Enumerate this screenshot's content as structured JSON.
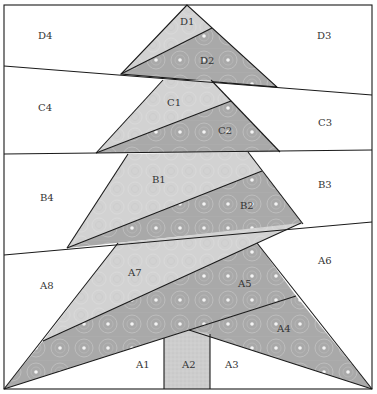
{
  "diagram": {
    "type": "foundation-paper-piecing quilt block",
    "colors": {
      "background": "#ffffff",
      "light_fabric": "#d2d2d2",
      "dark_fabric": "#a9a9a9",
      "trunk_fabric": "#cdcdcd",
      "line": "#1a1a1a",
      "dot": "#f4f4f4"
    },
    "sections": [
      {
        "name": "D",
        "pieces": [
          "D1",
          "D2",
          "D3",
          "D4"
        ]
      },
      {
        "name": "C",
        "pieces": [
          "C1",
          "C2",
          "C3",
          "C4"
        ]
      },
      {
        "name": "B",
        "pieces": [
          "B1",
          "B2",
          "B3",
          "B4"
        ]
      },
      {
        "name": "A",
        "pieces": [
          "A1",
          "A2",
          "A3",
          "A4",
          "A5",
          "A6",
          "A7",
          "A8"
        ]
      }
    ],
    "labels": {
      "D1": "D1",
      "D2": "D2",
      "D3": "D3",
      "D4": "D4",
      "C1": "C1",
      "C2": "C2",
      "C3": "C3",
      "C4": "C4",
      "B1": "B1",
      "B2": "B2",
      "B3": "B3",
      "B4": "B4",
      "A1": "A1",
      "A2": "A2",
      "A3": "A3",
      "A4": "A4",
      "A5": "A5",
      "A6": "A6",
      "A7": "A7",
      "A8": "A8"
    }
  }
}
